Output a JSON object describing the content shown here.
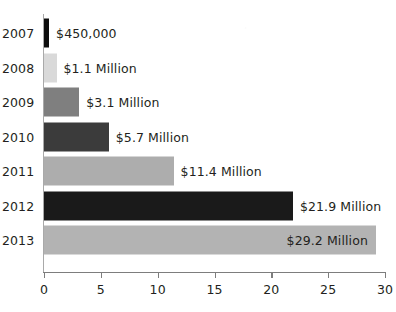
{
  "chart_data": {
    "type": "bar",
    "orientation": "horizontal",
    "title": "",
    "subtitle": "",
    "xlabel": "",
    "ylabel": "",
    "categories": [
      "2007",
      "2008",
      "2009",
      "2010",
      "2011",
      "2012",
      "2013"
    ],
    "values": [
      0.45,
      1.1,
      3.1,
      5.7,
      11.4,
      21.9,
      29.2
    ],
    "data_labels": [
      "$450,000",
      "$1.1 Million",
      "$3.1 Million",
      "$5.7 Million",
      "$11.4 Million",
      "$21.9 Million",
      "$29.2 Million"
    ],
    "label_placement": [
      "outside",
      "outside",
      "outside",
      "outside",
      "outside",
      "outside",
      "inside"
    ],
    "bar_colors": [
      "#0d0d0d",
      "#d9d9d9",
      "#7f7f7f",
      "#3b3b3b",
      "#adadad",
      "#1a1a1a",
      "#b3b3b3"
    ],
    "xlim": [
      0,
      30
    ],
    "xticks": [
      "0",
      "5",
      "10",
      "15",
      "20",
      "25",
      "30"
    ],
    "xtick_values": [
      0,
      5,
      10,
      15,
      20,
      25,
      30
    ],
    "grid": false,
    "legend": false,
    "axis_color": "#7d7d7d",
    "background_color": "#ffffff",
    "text_color": "#231f20"
  }
}
